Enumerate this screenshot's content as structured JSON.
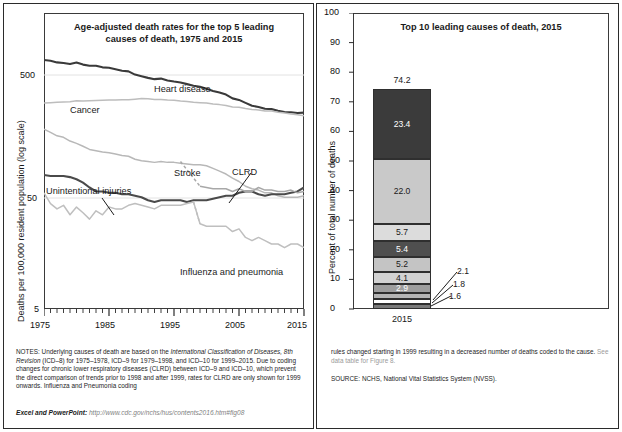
{
  "figure": {
    "left_panel": {
      "title": "Age-adjusted death rates for the top 5 leading causes of death, 1975 and 2015",
      "title_line1": "Age-adjusted death rates for the top 5 leading",
      "title_line2": "causes of death, 1975 and 2015",
      "ylabel": "Deaths per 100,000 resident population (log scale)"
    },
    "right_panel": {
      "title": "Top 10 leading causes of death, 2015",
      "ylabel": "Percent of total number of deaths",
      "legend_title": "(Rank) Underlying Cause of Death"
    },
    "notes": {
      "left_p1_a": "NOTES: Underlying causes of death are based on the ",
      "left_p1_i": "International Classification of Diseases, 8th Revision",
      "left_p1_b": " (ICD–8) for 1975–1978, ICD–9 for 1979–1998, and ICD–10 for 1999–2015. Due to coding changes for chronic lower respiratory diseases (CLRD) between ICD–9 and ICD–10, which prevent the direct comparison of trends prior to 1998 and after 1999, rates for CLRD are only shown for 1999 onwards. Influenza and Pneumonia coding",
      "right_p1": "rules changed starting in 1999 resulting in a decreased number of deaths coded to the cause. ",
      "right_p1_link": "See data table for Figure 8.",
      "source": "SOURCE: NCHS, National Vital Statistics System (NVSS).",
      "excel_label": "Excel and PowerPoint: ",
      "excel_url": "http://www.cdc.gov/nchs/hus/contents2016.htm#fig08"
    },
    "colors": {
      "heart_disease": "#3a3a3a",
      "cancer": "#bdbdbd",
      "stroke": "#b8b8b8",
      "unintentional_injuries": "#4a4a4a",
      "clrd": "#a8a8a8",
      "influenza": "#bfbfbf",
      "frame": "#2b2b2b",
      "gridline": "#dcdcdc"
    }
  },
  "chart_data": [
    {
      "id": "left-line-chart",
      "type": "line",
      "title": "Age-adjusted death rates for the top 5 leading causes of death, 1975 and 2015",
      "xlabel": "",
      "ylabel": "Deaths per 100,000 resident population (log scale)",
      "yscale": "log",
      "ylim": [
        5,
        1000
      ],
      "ytick_labels": [
        "500",
        "50",
        "5"
      ],
      "ytick_values": [
        500,
        50,
        5
      ],
      "xlim": [
        1975,
        2015
      ],
      "xtick_labels": [
        "1975",
        "1985",
        "1995",
        "2005",
        "2015"
      ],
      "xtick_values": [
        1975,
        1985,
        1995,
        2005,
        2015
      ],
      "minor_ticks": "every year",
      "grid": "two faint horizontal gridlines at 500 and 50",
      "annotations": [
        {
          "text": "Heart disease",
          "x": 1992,
          "y": 380
        },
        {
          "text": "Cancer",
          "x": 1981,
          "y": 280
        },
        {
          "text": "Stroke",
          "x": 1997,
          "y": 85
        },
        {
          "text": "CLRD",
          "x": 2006,
          "y": 80
        },
        {
          "text": "Unintentional injuries",
          "x": 1977,
          "y": 57,
          "leader": true
        },
        {
          "text": "Influenza and pneumonia",
          "x": 2004,
          "y": 16
        }
      ],
      "series": [
        {
          "name": "Heart disease",
          "color": "#3a3a3a",
          "x": [
            1975,
            1976,
            1977,
            1978,
            1979,
            1980,
            1981,
            1982,
            1983,
            1984,
            1985,
            1986,
            1987,
            1988,
            1989,
            1990,
            1991,
            1992,
            1993,
            1994,
            1995,
            1996,
            1997,
            1998,
            1999,
            2000,
            2001,
            2002,
            2003,
            2004,
            2005,
            2006,
            2007,
            2008,
            2009,
            2010,
            2011,
            2012,
            2013,
            2014,
            2015
          ],
          "values": [
            431,
            425,
            413,
            409,
            401,
            412,
            397,
            389,
            389,
            378,
            375,
            365,
            356,
            352,
            332,
            322,
            313,
            306,
            309,
            299,
            293,
            288,
            280,
            272,
            267,
            258,
            248,
            241,
            232,
            217,
            211,
            200,
            190,
            186,
            180,
            179,
            174,
            170,
            169,
            167,
            168
          ]
        },
        {
          "name": "Cancer",
          "color": "#bdbdbd",
          "x": [
            1975,
            1976,
            1977,
            1978,
            1979,
            1980,
            1981,
            1982,
            1983,
            1984,
            1985,
            1986,
            1987,
            1988,
            1989,
            1990,
            1991,
            1992,
            1993,
            1994,
            1995,
            1996,
            1997,
            1998,
            1999,
            2000,
            2001,
            2002,
            2003,
            2004,
            2005,
            2006,
            2007,
            2008,
            2009,
            2010,
            2011,
            2012,
            2013,
            2014,
            2015
          ],
          "values": [
            200,
            201,
            202,
            203,
            204,
            208,
            207,
            208,
            209,
            210,
            211,
            211,
            212,
            212,
            214,
            216,
            215,
            213,
            213,
            211,
            210,
            207,
            205,
            202,
            201,
            200,
            196,
            194,
            191,
            186,
            185,
            181,
            178,
            176,
            173,
            173,
            169,
            167,
            164,
            162,
            159
          ]
        },
        {
          "name": "Stroke",
          "color": "#b8b8b8",
          "x": [
            1975,
            1976,
            1977,
            1978,
            1979,
            1980,
            1981,
            1982,
            1983,
            1984,
            1985,
            1986,
            1987,
            1988,
            1989,
            1990,
            1991,
            1992,
            1993,
            1994,
            1995,
            1996,
            1997,
            1998,
            1999,
            2000,
            2001,
            2002,
            2003,
            2004,
            2005,
            2006,
            2007,
            2008,
            2009,
            2010,
            2011,
            2012,
            2013,
            2014,
            2015
          ],
          "values": [
            125,
            118,
            111,
            108,
            101,
            97,
            92,
            87,
            85,
            83,
            82,
            80,
            78,
            77,
            73,
            71,
            70,
            69,
            70,
            69,
            69,
            68,
            67,
            66,
            66,
            65,
            62,
            59,
            56,
            52,
            49,
            45,
            43,
            42,
            40,
            40,
            38,
            37,
            37,
            37,
            38
          ]
        },
        {
          "name": "Unintentional injuries",
          "color": "#4a4a4a",
          "x": [
            1975,
            1976,
            1977,
            1978,
            1979,
            1980,
            1981,
            1982,
            1983,
            1984,
            1985,
            1986,
            1987,
            1988,
            1989,
            1990,
            1991,
            1992,
            1993,
            1994,
            1995,
            1996,
            1997,
            1998,
            1999,
            2000,
            2001,
            2002,
            2003,
            2004,
            2005,
            2006,
            2007,
            2008,
            2009,
            2010,
            2011,
            2012,
            2013,
            2014,
            2015
          ],
          "values": [
            55,
            54,
            54,
            54,
            53,
            51,
            48,
            44,
            41,
            41,
            40,
            40,
            39,
            39,
            38,
            37,
            35,
            34,
            35,
            35,
            35,
            35,
            34,
            35,
            35,
            35,
            36,
            37,
            38,
            38,
            40,
            41,
            41,
            39,
            38,
            39,
            39,
            39,
            40,
            41,
            44
          ]
        },
        {
          "name": "CLRD",
          "color": "#a8a8a8",
          "note": "shown for 1999 onwards only; dashed connector before 1999",
          "x": [
            1999,
            2000,
            2001,
            2002,
            2003,
            2004,
            2005,
            2006,
            2007,
            2008,
            2009,
            2010,
            2011,
            2012,
            2013,
            2014,
            2015
          ],
          "values": [
            45,
            44,
            43,
            43,
            43,
            41,
            43,
            41,
            41,
            44,
            42,
            42,
            41,
            41,
            42,
            40,
            41
          ]
        },
        {
          "name": "Influenza and pneumonia",
          "color": "#bfbfbf",
          "x": [
            1975,
            1976,
            1977,
            1978,
            1979,
            1980,
            1981,
            1982,
            1983,
            1984,
            1985,
            1986,
            1987,
            1988,
            1989,
            1990,
            1991,
            1992,
            1993,
            1994,
            1995,
            1996,
            1997,
            1998,
            1999,
            2000,
            2001,
            2002,
            2003,
            2004,
            2005,
            2006,
            2007,
            2008,
            2009,
            2010,
            2011,
            2012,
            2013,
            2014,
            2015
          ],
          "values": [
            40,
            33,
            30,
            32,
            27,
            31,
            28,
            25,
            29,
            27,
            31,
            30,
            30,
            32,
            33,
            32,
            31,
            30,
            32,
            32,
            32,
            32,
            33,
            34,
            23,
            22,
            22,
            22,
            22,
            20,
            21,
            18,
            17,
            18,
            17,
            16,
            16,
            15,
            16,
            16,
            15
          ]
        }
      ]
    },
    {
      "id": "right-stacked-bar",
      "type": "bar",
      "subtype": "stacked",
      "title": "Top 10 leading causes of death, 2015",
      "xlabel": "",
      "ylabel": "Percent of total number of deaths",
      "categories": [
        "2015"
      ],
      "ylim": [
        0,
        100
      ],
      "ytick_labels": [
        "0",
        "10",
        "20",
        "30",
        "40",
        "50",
        "60",
        "70",
        "80",
        "90",
        "100"
      ],
      "ytick_values": [
        0,
        10,
        20,
        30,
        40,
        50,
        60,
        70,
        80,
        90,
        100
      ],
      "total_label": "74.2",
      "total_value": 74.2,
      "legend_title": "(Rank) Underlying Cause of Death",
      "legend_position": "right",
      "segments": [
        {
          "rank": 1,
          "label": "(1) Heart disease",
          "name": "Heart disease",
          "value": 23.4,
          "value_label": "23.4",
          "color": "#3b3b3b",
          "text_color": "#ffffff",
          "callout": false
        },
        {
          "rank": 2,
          "label": "(2) Cancer",
          "name": "Cancer",
          "value": 22.0,
          "value_label": "22.0",
          "color": "#c9c9c9",
          "text_color": "#1a1a1a",
          "callout": false
        },
        {
          "rank": 3,
          "label": "(3) CLRD",
          "name": "CLRD",
          "value": 5.7,
          "value_label": "5.7",
          "color": "#dcdcdc",
          "text_color": "#1a1a1a",
          "callout": false
        },
        {
          "rank": 4,
          "label": "(4) Unintentional injuries",
          "name": "Unintentional injuries",
          "value": 5.4,
          "value_label": "5.4",
          "color": "#4f4f4f",
          "text_color": "#ffffff",
          "callout": false
        },
        {
          "rank": 5,
          "label": "(5) Stroke",
          "name": "Stroke",
          "value": 5.2,
          "value_label": "5.2",
          "color": "#c4c4c4",
          "text_color": "#1a1a1a",
          "callout": false
        },
        {
          "rank": 6,
          "label": "(6) Alzheimer's disease",
          "name": "Alzheimer's disease",
          "value": 4.1,
          "value_label": "4.1",
          "color": "#d2d2d2",
          "text_color": "#1a1a1a",
          "callout": false
        },
        {
          "rank": 7,
          "label": "(7) Diabetes mellitus",
          "name": "Diabetes mellitus",
          "value": 2.9,
          "value_label": "2.9",
          "color": "#9e9e9e",
          "text_color": "#ffffff",
          "callout": false
        },
        {
          "rank": 8,
          "label_line1": "(8) Influenza and",
          "label_line2": "pneumonia",
          "label": "(8) Influenza and pneumonia",
          "name": "Influenza and pneumonia",
          "value": 2.1,
          "value_label": "2.1",
          "color": "#b5b5b5",
          "text_color": "#1a1a1a",
          "callout": true
        },
        {
          "rank": 9,
          "label_line1": "(9) Nephritis, nephrotic",
          "label_line2": "syndrome, and nephrosis",
          "label": "(9) Nephritis, nephrotic syndrome, and nephrosis",
          "name": "Nephritis, nephrotic syndrome, and nephrosis",
          "value": 1.8,
          "value_label": "1.8",
          "color": "#ffffff",
          "text_color": "#1a1a1a",
          "callout": true
        },
        {
          "rank": 10,
          "label": "(10) Suicide",
          "name": "Suicide",
          "value": 1.6,
          "value_label": "1.6",
          "color": "#7a7a7a",
          "text_color": "#ffffff",
          "callout": true
        }
      ]
    }
  ]
}
